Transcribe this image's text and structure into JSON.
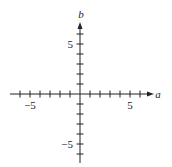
{
  "chart_data": {
    "type": "line",
    "title": "",
    "xlabel": "a",
    "ylabel": "b",
    "xlim": [
      -7,
      7
    ],
    "ylim": [
      -7,
      7
    ],
    "x_ticks": [
      -6,
      -5,
      -4,
      -3,
      -2,
      -1,
      1,
      2,
      3,
      4,
      5,
      6
    ],
    "y_ticks": [
      -6,
      -5,
      -4,
      -3,
      -2,
      -1,
      1,
      2,
      3,
      4,
      5,
      6
    ],
    "x_tick_labels": [
      "-5",
      "5"
    ],
    "y_tick_labels": [
      "5",
      "-5"
    ],
    "grid": false,
    "legend": null,
    "series": []
  },
  "labels": {
    "x_axis": "a",
    "y_axis": "b",
    "x_neg5": "−5",
    "x_pos5": "5",
    "y_pos5": "5",
    "y_neg5": "−5"
  },
  "colors": {
    "axis": "#222222"
  }
}
